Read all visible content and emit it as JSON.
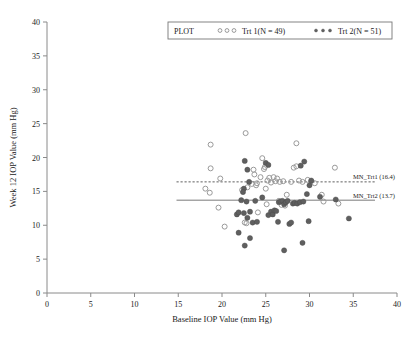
{
  "chart_data": {
    "type": "scatter",
    "title": "",
    "xlabel": "Baseline IOP Value (mm Hg)",
    "ylabel": "Week 12 IOP Value (mm Hg)",
    "xlim": [
      0,
      40
    ],
    "ylim": [
      0,
      40
    ],
    "xticks": [
      0,
      5,
      10,
      15,
      20,
      25,
      30,
      35,
      40
    ],
    "yticks": [
      0,
      5,
      10,
      15,
      20,
      25,
      30,
      35,
      40
    ],
    "grid": false,
    "legend_position": "top-center",
    "legend_title": "PLOT",
    "series": [
      {
        "name": "Trt 1(N = 49)",
        "marker": "open-circle",
        "color": "#9a9a9a",
        "n": 49,
        "points": [
          [
            18.7,
            21.9
          ],
          [
            22.7,
            23.6
          ],
          [
            28.5,
            22.1
          ],
          [
            18.7,
            18.4
          ],
          [
            19.8,
            16.9
          ],
          [
            18.1,
            15.4
          ],
          [
            18.6,
            14.8
          ],
          [
            19.6,
            12.6
          ],
          [
            20.3,
            9.8
          ],
          [
            22.6,
            10.4
          ],
          [
            22.8,
            10.3
          ],
          [
            22.9,
            15.6
          ],
          [
            23.4,
            16.1
          ],
          [
            23.6,
            18.2
          ],
          [
            23.7,
            17.5
          ],
          [
            23.9,
            15.9
          ],
          [
            24.0,
            16.2
          ],
          [
            24.1,
            11.9
          ],
          [
            24.4,
            17.1
          ],
          [
            24.6,
            19.9
          ],
          [
            24.8,
            18.3
          ],
          [
            24.9,
            18.6
          ],
          [
            25.0,
            15.4
          ],
          [
            25.2,
            16.6
          ],
          [
            25.4,
            17.0
          ],
          [
            25.6,
            16.3
          ],
          [
            25.9,
            17.1
          ],
          [
            26.1,
            16.5
          ],
          [
            26.3,
            16.9
          ],
          [
            26.5,
            13.6
          ],
          [
            26.6,
            16.4
          ],
          [
            26.8,
            13.0
          ],
          [
            27.0,
            16.5
          ],
          [
            27.2,
            12.9
          ],
          [
            27.4,
            14.5
          ],
          [
            27.9,
            16.4
          ],
          [
            28.2,
            18.5
          ],
          [
            28.5,
            18.7
          ],
          [
            28.8,
            16.6
          ],
          [
            29.2,
            16.4
          ],
          [
            29.8,
            16.7
          ],
          [
            30.2,
            16.5
          ],
          [
            30.6,
            16.2
          ],
          [
            31.4,
            14.5
          ],
          [
            31.6,
            13.5
          ],
          [
            32.9,
            18.5
          ],
          [
            33.3,
            13.2
          ],
          [
            25.1,
            13.1
          ],
          [
            22.3,
            15.2
          ]
        ]
      },
      {
        "name": "Trt 2(N = 51)",
        "marker": "filled-circle",
        "color": "#5f5f5f",
        "n": 51,
        "points": [
          [
            22.6,
            7.0
          ],
          [
            21.9,
            8.9
          ],
          [
            23.2,
            8.1
          ],
          [
            27.1,
            6.3
          ],
          [
            29.2,
            7.4
          ],
          [
            21.7,
            11.6
          ],
          [
            21.9,
            11.9
          ],
          [
            22.5,
            11.8
          ],
          [
            22.9,
            11.1
          ],
          [
            23.2,
            12.0
          ],
          [
            23.5,
            10.4
          ],
          [
            24.0,
            10.5
          ],
          [
            25.3,
            11.5
          ],
          [
            25.6,
            12.0
          ],
          [
            25.8,
            11.6
          ],
          [
            26.0,
            12.2
          ],
          [
            26.2,
            12.1
          ],
          [
            26.5,
            13.4
          ],
          [
            26.7,
            13.5
          ],
          [
            26.9,
            13.6
          ],
          [
            27.1,
            13.1
          ],
          [
            27.3,
            13.4
          ],
          [
            27.5,
            13.6
          ],
          [
            27.7,
            10.2
          ],
          [
            27.9,
            10.4
          ],
          [
            28.1,
            13.2
          ],
          [
            28.3,
            13.3
          ],
          [
            28.6,
            13.2
          ],
          [
            28.9,
            13.4
          ],
          [
            29.3,
            13.5
          ],
          [
            30.0,
            15.9
          ],
          [
            30.2,
            16.6
          ],
          [
            29.4,
            19.4
          ],
          [
            29.0,
            18.8
          ],
          [
            29.7,
            14.6
          ],
          [
            22.6,
            19.5
          ],
          [
            22.9,
            18.2
          ],
          [
            23.1,
            16.4
          ],
          [
            22.5,
            15.4
          ],
          [
            22.4,
            14.9
          ],
          [
            22.2,
            13.7
          ],
          [
            22.8,
            13.5
          ],
          [
            23.8,
            13.6
          ],
          [
            24.6,
            14.1
          ],
          [
            25.0,
            19.2
          ],
          [
            25.3,
            18.9
          ],
          [
            26.4,
            10.5
          ],
          [
            29.9,
            10.6
          ],
          [
            31.2,
            14.2
          ],
          [
            33.0,
            13.8
          ],
          [
            34.5,
            11.0
          ]
        ]
      }
    ],
    "reference_lines": [
      {
        "label": "MN_Trt1 (16.4)",
        "value": 16.4,
        "style": "dashed",
        "color": "#4d4d4d"
      },
      {
        "label": "MN_Trt2 (13.7)",
        "value": 13.7,
        "style": "solid",
        "color": "#6b6b6b"
      }
    ]
  }
}
